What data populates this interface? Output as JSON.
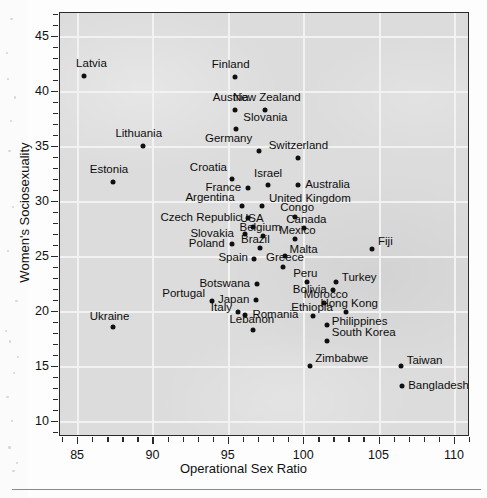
{
  "figure": {
    "background_color": "#dcdcdc",
    "point_color": "#101010",
    "axis_color": "#2a2a2a",
    "grid_color": "#f2f2f2"
  },
  "axes": {
    "x_title": "Operational Sex Ratio",
    "y_title": "Women's Sociosexuality",
    "x_ticks": [
      "85",
      "90",
      "95",
      "100",
      "105",
      "110"
    ],
    "y_ticks": [
      "10",
      "15",
      "20",
      "25",
      "30",
      "35",
      "40",
      "45"
    ]
  },
  "chart_data": {
    "type": "scatter",
    "title": "",
    "xlabel": "Operational Sex Ratio",
    "ylabel": "Women's Sociosexuality",
    "xlim": [
      83.8,
      111.0
    ],
    "ylim": [
      8.6,
      47.2
    ],
    "xticks": [
      85,
      90,
      95,
      100,
      105,
      110
    ],
    "yticks": [
      10,
      15,
      20,
      25,
      30,
      35,
      40,
      45
    ],
    "xminor_step": 1,
    "yminor_step": 1,
    "grid": true,
    "legend": "none",
    "points": [
      {
        "label": "Latvia",
        "x": 85.4,
        "y": 41.5,
        "lx": -8,
        "ly": -13,
        "anchor": "start"
      },
      {
        "label": "Finland",
        "x": 95.4,
        "y": 41.4,
        "lx": -4,
        "ly": -13,
        "anchor": "middle"
      },
      {
        "label": "Austria",
        "x": 95.4,
        "y": 38.4,
        "lx": -4,
        "ly": -13,
        "anchor": "middle"
      },
      {
        "label": "New Zealand",
        "x": 97.4,
        "y": 38.4,
        "lx": 2,
        "ly": -13,
        "anchor": "middle"
      },
      {
        "label": "Slovania",
        "x": 95.5,
        "y": 36.6,
        "lx": 7,
        "ly": -12,
        "anchor": "start"
      },
      {
        "label": "Lithuania",
        "x": 89.3,
        "y": 35.1,
        "lx": -4,
        "ly": -13,
        "anchor": "middle"
      },
      {
        "label": "Germany",
        "x": 97.0,
        "y": 34.6,
        "lx": -7,
        "ly": -13,
        "anchor": "end"
      },
      {
        "label": "Switzerland",
        "x": 99.6,
        "y": 34.0,
        "lx": 0,
        "ly": -13,
        "anchor": "middle"
      },
      {
        "label": "Estonia",
        "x": 87.3,
        "y": 31.8,
        "lx": -4,
        "ly": -13,
        "anchor": "middle"
      },
      {
        "label": "Croatia",
        "x": 95.2,
        "y": 32.1,
        "lx": -5,
        "ly": -12,
        "anchor": "end"
      },
      {
        "label": "Israel",
        "x": 97.6,
        "y": 31.5,
        "lx": 0,
        "ly": -12,
        "anchor": "middle"
      },
      {
        "label": "Australia",
        "x": 99.6,
        "y": 31.5,
        "lx": 7,
        "ly": -1,
        "anchor": "start"
      },
      {
        "label": "France",
        "x": 96.3,
        "y": 31.3,
        "lx": -7,
        "ly": -1,
        "anchor": "end"
      },
      {
        "label": "Argentina",
        "x": 95.9,
        "y": 29.6,
        "lx": -8,
        "ly": -9,
        "anchor": "end"
      },
      {
        "label": "United Kingdom",
        "x": 97.2,
        "y": 29.6,
        "lx": 7,
        "ly": -8,
        "anchor": "start"
      },
      {
        "label": "Czech Republic",
        "x": 96.3,
        "y": 28.5,
        "lx": -7,
        "ly": -1,
        "anchor": "end"
      },
      {
        "label": "Congo",
        "x": 99.4,
        "y": 28.6,
        "lx": 2,
        "ly": -10,
        "anchor": "middle"
      },
      {
        "label": "USA",
        "x": 96.6,
        "y": 27.7,
        "lx": -1,
        "ly": -9,
        "anchor": "middle"
      },
      {
        "label": "Canada",
        "x": 100.0,
        "y": 27.6,
        "lx": 2,
        "ly": -9,
        "anchor": "middle"
      },
      {
        "label": "Belgium",
        "x": 97.3,
        "y": 26.9,
        "lx": -3,
        "ly": -9,
        "anchor": "middle"
      },
      {
        "label": "Slovakia",
        "x": 96.1,
        "y": 27.1,
        "lx": -12,
        "ly": -1,
        "anchor": "end"
      },
      {
        "label": "Mexico",
        "x": 99.4,
        "y": 26.6,
        "lx": 2,
        "ly": -9,
        "anchor": "middle"
      },
      {
        "label": "Poland",
        "x": 95.2,
        "y": 26.2,
        "lx": -7,
        "ly": -1,
        "anchor": "end"
      },
      {
        "label": "Brazil",
        "x": 97.1,
        "y": 25.8,
        "lx": -5,
        "ly": -9,
        "anchor": "middle"
      },
      {
        "label": "Fiji",
        "x": 104.5,
        "y": 25.7,
        "lx": 6,
        "ly": -8,
        "anchor": "start"
      },
      {
        "label": "Spain",
        "x": 96.7,
        "y": 24.8,
        "lx": -7,
        "ly": -2,
        "anchor": "end"
      },
      {
        "label": "Malta",
        "x": 98.7,
        "y": 25.1,
        "lx": 5,
        "ly": -7,
        "anchor": "start"
      },
      {
        "label": "Greece",
        "x": 98.6,
        "y": 24.1,
        "lx": 2,
        "ly": -10,
        "anchor": "middle"
      },
      {
        "label": "Botswana",
        "x": 96.9,
        "y": 22.5,
        "lx": -7,
        "ly": -1,
        "anchor": "end"
      },
      {
        "label": "Peru",
        "x": 100.2,
        "y": 22.7,
        "lx": -2,
        "ly": -9,
        "anchor": "middle"
      },
      {
        "label": "Turkey",
        "x": 102.1,
        "y": 22.7,
        "lx": 6,
        "ly": -5,
        "anchor": "start"
      },
      {
        "label": "Bolivia",
        "x": 101.9,
        "y": 22.0,
        "lx": -6,
        "ly": -1,
        "anchor": "end"
      },
      {
        "label": "Portugal",
        "x": 93.9,
        "y": 21.0,
        "lx": -7,
        "ly": -8,
        "anchor": "end"
      },
      {
        "label": "Japan",
        "x": 96.8,
        "y": 21.1,
        "lx": -7,
        "ly": -1,
        "anchor": "end"
      },
      {
        "label": "Morocco",
        "x": 101.3,
        "y": 20.8,
        "lx": 2,
        "ly": -9,
        "anchor": "middle"
      },
      {
        "label": "Italy",
        "x": 95.6,
        "y": 20.0,
        "lx": -6,
        "ly": -5,
        "anchor": "end"
      },
      {
        "label": "Romania",
        "x": 96.1,
        "y": 19.7,
        "lx": 7,
        "ly": -1,
        "anchor": "start"
      },
      {
        "label": "Hong Kong",
        "x": 102.8,
        "y": 20.0,
        "lx": 3,
        "ly": -9,
        "anchor": "middle"
      },
      {
        "label": "Ethiopia",
        "x": 100.6,
        "y": 19.6,
        "lx": -1,
        "ly": -9,
        "anchor": "middle"
      },
      {
        "label": "Philippines",
        "x": 101.5,
        "y": 18.8,
        "lx": 5,
        "ly": -4,
        "anchor": "start"
      },
      {
        "label": "Ukraine",
        "x": 87.3,
        "y": 18.6,
        "lx": -3,
        "ly": -11,
        "anchor": "middle"
      },
      {
        "label": "Lebanon",
        "x": 96.6,
        "y": 18.3,
        "lx": -1,
        "ly": -11,
        "anchor": "middle"
      },
      {
        "label": "South Korea",
        "x": 101.5,
        "y": 17.3,
        "lx": 5,
        "ly": -9,
        "anchor": "start"
      },
      {
        "label": "Zimbabwe",
        "x": 100.4,
        "y": 15.1,
        "lx": 5,
        "ly": -8,
        "anchor": "start"
      },
      {
        "label": "Taiwan",
        "x": 106.4,
        "y": 15.1,
        "lx": 6,
        "ly": -6,
        "anchor": "start"
      },
      {
        "label": "Bangladesh",
        "x": 106.5,
        "y": 13.2,
        "lx": 6,
        "ly": -1,
        "anchor": "start"
      }
    ]
  }
}
